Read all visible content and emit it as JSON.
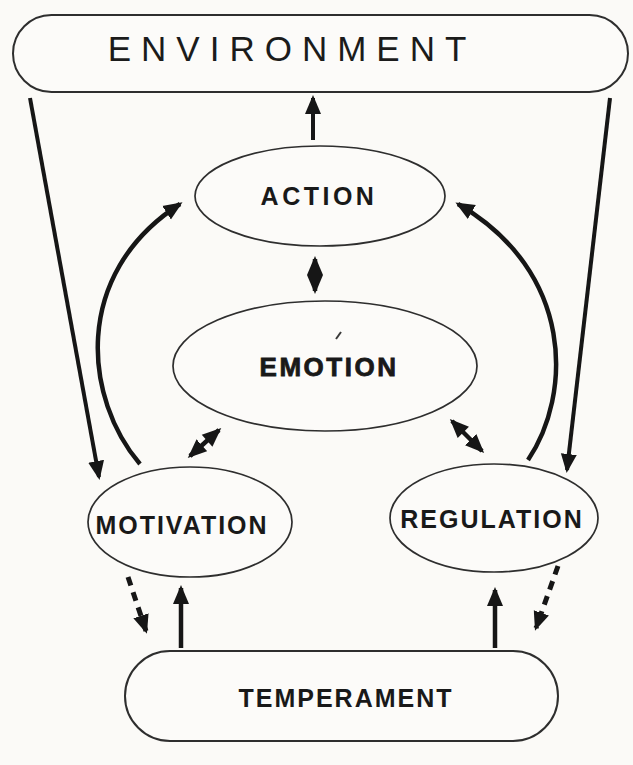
{
  "diagram": {
    "type": "concept-diagram",
    "nodes": {
      "environment": {
        "label": "ENVIRONMENT",
        "shape": "rounded-rectangle"
      },
      "action": {
        "label": "ACTION",
        "shape": "ellipse"
      },
      "emotion": {
        "label": "EMOTION",
        "shape": "ellipse",
        "emphasis": "bold"
      },
      "motivation": {
        "label": "MOTIVATION",
        "shape": "ellipse"
      },
      "regulation": {
        "label": "REGULATION",
        "shape": "ellipse"
      },
      "temperament": {
        "label": "TEMPERAMENT",
        "shape": "rounded-rectangle"
      }
    },
    "edges": [
      {
        "from": "action",
        "to": "environment",
        "style": "solid",
        "direction": "one-way"
      },
      {
        "from": "action",
        "to": "emotion",
        "style": "solid",
        "direction": "two-way"
      },
      {
        "from": "emotion",
        "to": "motivation",
        "style": "solid",
        "direction": "two-way"
      },
      {
        "from": "emotion",
        "to": "regulation",
        "style": "solid",
        "direction": "two-way"
      },
      {
        "from": "environment",
        "to": "motivation",
        "style": "solid",
        "direction": "one-way"
      },
      {
        "from": "environment",
        "to": "regulation",
        "style": "solid",
        "direction": "one-way"
      },
      {
        "from": "motivation",
        "to": "action",
        "style": "solid",
        "direction": "one-way",
        "path": "curved"
      },
      {
        "from": "regulation",
        "to": "action",
        "style": "solid",
        "direction": "one-way",
        "path": "curved"
      },
      {
        "from": "motivation",
        "to": "temperament",
        "style": "dashed",
        "direction": "one-way"
      },
      {
        "from": "regulation",
        "to": "temperament",
        "style": "dashed",
        "direction": "one-way"
      },
      {
        "from": "temperament",
        "to": "motivation",
        "style": "solid",
        "direction": "one-way"
      },
      {
        "from": "temperament",
        "to": "regulation",
        "style": "solid",
        "direction": "one-way"
      }
    ],
    "colors": {
      "background": "#fbfaf7",
      "ink": "#161616",
      "shape_fill": "#fcfbf9"
    }
  }
}
